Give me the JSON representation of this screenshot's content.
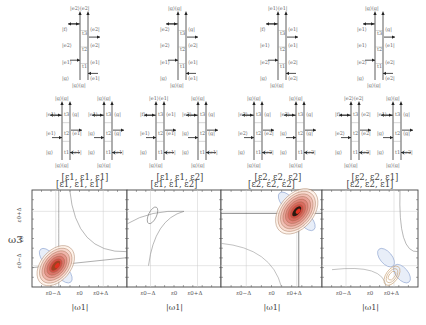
{
  "figure": {
    "top_diagrams": [
      {
        "id": "d1",
        "x": 72,
        "y": 8,
        "top_left": "|e2⟩",
        "top_right": "⟨e2|",
        "bottom_left": "|g⟩",
        "bottom_right": "⟨g|",
        "left_states": [
          "|f⟩",
          "|e2⟩",
          "|e1⟩",
          "|g⟩"
        ],
        "right_states": [
          "⟨e2|",
          "⟨e2|",
          "⟨e1|",
          "⟨e1|"
        ],
        "times": [
          "t3",
          "t2",
          "t1"
        ]
      },
      {
        "id": "d2",
        "x": 170,
        "y": 8,
        "top_left": "|g⟩",
        "top_right": "⟨g|",
        "bottom_left": "|g⟩",
        "bottom_right": "⟨g|",
        "left_states": [
          "|e2⟩",
          "|e2⟩",
          "|e1⟩",
          "|g⟩"
        ],
        "right_states": [
          "⟨g|",
          "⟨e2|",
          "⟨e1|",
          "⟨e1|"
        ],
        "times": [
          "t3",
          "t2",
          "t1"
        ]
      },
      {
        "id": "d3",
        "x": 270,
        "y": 8,
        "top_left": "|e1⟩",
        "top_right": "⟨e1|",
        "bottom_left": "|g⟩",
        "bottom_right": "⟨g|",
        "left_states": [
          "|f⟩",
          "|e1⟩",
          "|e2⟩",
          "|g⟩"
        ],
        "right_states": [
          "⟨e1|",
          "⟨e1|",
          "⟨e2|",
          "⟨e2|"
        ],
        "times": [
          "t3",
          "t2",
          "t1"
        ]
      },
      {
        "id": "d4",
        "x": 367,
        "y": 8,
        "top_left": "|g⟩",
        "top_right": "⟨g|",
        "bottom_left": "|g⟩",
        "bottom_right": "⟨g|",
        "left_states": [
          "|e1⟩",
          "|e1⟩",
          "|e2⟩",
          "|g⟩"
        ],
        "right_states": [
          "⟨g|",
          "⟨e1|",
          "⟨e2|",
          "⟨e2|"
        ],
        "times": [
          "t3",
          "t2",
          "t1"
        ]
      }
    ],
    "mid_diagrams": [
      {
        "x": 56,
        "y": 94,
        "top": "|g⟩⟨g|",
        "left_states": [
          "|e1⟩",
          "|e1⟩",
          "|g⟩"
        ],
        "right_states": [
          "⟨g|",
          "⟨e1|",
          "⟨e1|"
        ]
      },
      {
        "x": 98,
        "y": 94,
        "top": "|g⟩⟨g|",
        "left_states": [
          "|e1⟩",
          "|g⟩",
          "|g⟩"
        ],
        "right_states": [
          "⟨g|",
          "⟨g|",
          "⟨e1|"
        ]
      },
      {
        "x": 150,
        "y": 94,
        "top": "|e1⟩⟨e1|",
        "left_states": [
          "|f⟩",
          "|e1⟩",
          "|g⟩"
        ],
        "right_states": [
          "⟨e1|",
          "⟨e1|",
          "⟨e1|"
        ]
      },
      {
        "x": 192,
        "y": 94,
        "top": "|g⟩⟨g|",
        "left_states": [
          "|e2⟩",
          "|g⟩",
          "|g⟩"
        ],
        "right_states": [
          "⟨g|",
          "⟨g|",
          "⟨e1|"
        ]
      },
      {
        "x": 248,
        "y": 94,
        "top": "|g⟩⟨g|",
        "left_states": [
          "|e2⟩",
          "|e2⟩",
          "|g⟩"
        ],
        "right_states": [
          "⟨g|",
          "⟨e2|",
          "⟨e2|"
        ]
      },
      {
        "x": 290,
        "y": 94,
        "top": "|g⟩⟨g|",
        "left_states": [
          "|e2⟩",
          "|g⟩",
          "|g⟩"
        ],
        "right_states": [
          "⟨g|",
          "⟨g|",
          "⟨e2|"
        ]
      },
      {
        "x": 345,
        "y": 94,
        "top": "|e2⟩⟨e2|",
        "left_states": [
          "|f⟩",
          "|e2⟩",
          "|g⟩"
        ],
        "right_states": [
          "⟨e2|",
          "⟨e2|",
          "⟨e2|"
        ]
      },
      {
        "x": 387,
        "y": 94,
        "top": "|g⟩⟨g|",
        "left_states": [
          "|e1⟩",
          "|g⟩",
          "|g⟩"
        ],
        "right_states": [
          "⟨g|",
          "⟨g|",
          "⟨e2|"
        ]
      }
    ],
    "group_labels": [
      "[ε1, ε1, ε1]",
      "[ε1, ε1, ε2]",
      "[ε2, ε2, ε2]",
      "[ε2, ε2, ε1]"
    ],
    "panel_titles": [
      "[ε1, ε1, ε1]",
      "[ε1, ε1, ε2]",
      "[ε2, ε2, ε2]",
      "[ε2, ε2, ε1]"
    ],
    "y_axis_label": "ω3",
    "y_ticks": [
      "ε0+Δ",
      "ε0",
      "ε0−Δ"
    ],
    "x_axis_label": "|ω1|",
    "x_ticks": [
      "ε0−Δ",
      "ε0",
      "ε0+Δ"
    ]
  },
  "chart_data": {
    "type": "heatmap",
    "xlabel": "|ω1|",
    "ylabel": "ω3",
    "x_ticks": [
      "ε0−Δ",
      "ε0",
      "ε0+Δ"
    ],
    "y_ticks": [
      "ε0−Δ",
      "ε0",
      "ε0+Δ"
    ],
    "panels": [
      {
        "title": "[ε1, ε1, ε1]",
        "peak": {
          "x": "ε0−Δ",
          "y": "ε0−Δ"
        },
        "peak_strength": "strong",
        "colors": [
          "red",
          "blue"
        ]
      },
      {
        "title": "[ε1, ε1, ε2]",
        "peak": {
          "x": "ε0−Δ",
          "y": "ε0+Δ"
        },
        "peak_strength": "weak",
        "colors": [
          "gray"
        ]
      },
      {
        "title": "[ε2, ε2, ε2]",
        "peak": {
          "x": "ε0+Δ",
          "y": "ε0+Δ"
        },
        "peak_strength": "strongest",
        "colors": [
          "red",
          "blue"
        ]
      },
      {
        "title": "[ε2, ε2, ε1]",
        "peak": {
          "x": "ε0+Δ",
          "y": "ε0−Δ"
        },
        "peak_strength": "weak",
        "colors": [
          "orange",
          "blue"
        ]
      }
    ]
  }
}
